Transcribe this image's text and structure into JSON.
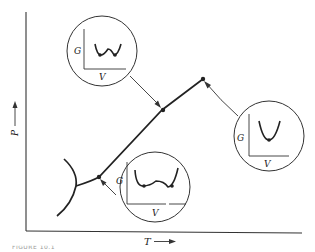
{
  "diagram": {
    "type": "phase-diagram",
    "axes": {
      "x_label": "T",
      "y_label": "P",
      "x_arrow": "right-arrow",
      "y_arrow": "up-arrow"
    },
    "insets": [
      {
        "id": "inset-top-left",
        "y_label": "G",
        "x_label": "V",
        "curve": "double-well with two equal minima (near triple point, coexistence)",
        "points_to": "mid point on coexistence line"
      },
      {
        "id": "inset-right",
        "y_label": "G",
        "x_label": "V",
        "curve": "single-well with one minimum (beyond critical point)",
        "points_to": "critical point (end of line)"
      },
      {
        "id": "inset-bottom",
        "y_label": "G",
        "x_label": "V",
        "curve": "double-well with two equal minima (coexistence)",
        "points_to": "lower point on coexistence line"
      }
    ]
  },
  "caption": "FIGURE 10.1"
}
